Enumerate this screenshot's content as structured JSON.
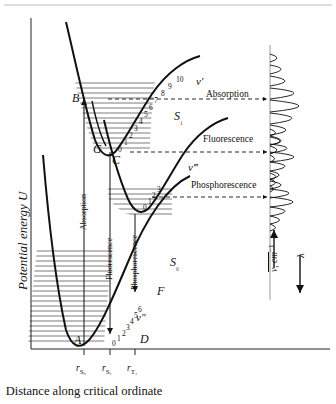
{
  "figure": {
    "axis_y_label": "Potential energy U",
    "axis_x_caption": "Distance along critical ordinate",
    "x_ticks": [
      "r",
      "r",
      "r"
    ],
    "x_tick_subs": [
      "S₀",
      "S₁",
      "T₁"
    ]
  },
  "states": {
    "ground": {
      "label": "S",
      "sub": "₀",
      "vib_label": "v",
      "vib_prime": "″"
    },
    "singlet_excited": {
      "label": "S",
      "sub": "₁",
      "vib_label": "v",
      "vib_prime": "′"
    },
    "triplet": {
      "label": "",
      "sub": "",
      "vib_label": "v",
      "vib_prime": "‴"
    }
  },
  "points": [
    {
      "name": "A",
      "label": "A"
    },
    {
      "name": "B",
      "label": "B"
    },
    {
      "name": "C",
      "label": "C"
    },
    {
      "name": "D",
      "label": "D"
    },
    {
      "name": "F",
      "label": "F"
    },
    {
      "name": "G",
      "label": "G"
    }
  ],
  "transitions": {
    "absorption": "Absorption",
    "fluorescence": "Fluorescence",
    "phosphorescence": "Phosphorescence"
  },
  "spectra": {
    "absorption_label": "Absorption",
    "fluorescence_label": "Fluorescence",
    "phosphorescence_label": "Phosphorescence",
    "wavenumber_axis": "ν, cm",
    "wavenumber_sup": "−1",
    "wavelength_axis": "λ"
  },
  "vibrational_numbers": {
    "singlet_excited": [
      "0",
      "1",
      "2",
      "3",
      "4",
      "5",
      "6",
      "7",
      "8",
      "9",
      "10"
    ],
    "triplet": [
      "0",
      "1",
      "2",
      "3"
    ],
    "ground": [
      "0",
      "1",
      "2",
      "3",
      "4",
      "5",
      "6"
    ]
  },
  "chart_data": {
    "type": "line",
    "title": "",
    "xlabel": "Distance along critical ordinate",
    "ylabel": "Potential energy U",
    "series": [
      {
        "name": "S0 ground state Morse potential",
        "minimum_x_label": "r_S0"
      },
      {
        "name": "S1 excited singlet Morse potential",
        "minimum_x_label": "r_S1"
      },
      {
        "name": "T1 triplet Morse potential",
        "minimum_x_label": "r_T1"
      }
    ],
    "spectra_bands": [
      {
        "name": "Absorption",
        "peaks": [
          0.3,
          0.46,
          0.62,
          0.86,
          1.0,
          0.8,
          0.58,
          0.4,
          0.26,
          0.16
        ]
      },
      {
        "name": "Fluorescence",
        "peaks": [
          0.22,
          0.4,
          0.7,
          1.0,
          0.62,
          0.38,
          0.22,
          0.12
        ]
      },
      {
        "name": "Phosphorescence",
        "peaks": [
          0.24,
          0.48,
          0.82,
          1.0,
          0.66,
          0.4,
          0.22
        ]
      }
    ]
  }
}
